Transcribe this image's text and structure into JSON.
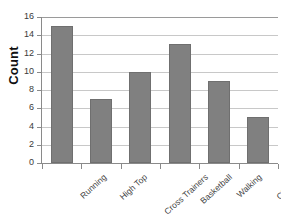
{
  "chart_data": {
    "type": "bar",
    "title": "",
    "xlabel": "",
    "ylabel": "Count",
    "categories": [
      "Running",
      "High Top",
      "Cross Trainers",
      "Basketball",
      "Walking",
      "Climbing"
    ],
    "values": [
      15,
      7,
      10,
      13,
      9,
      5
    ],
    "ylim": [
      0,
      16
    ],
    "ytick_step": 2,
    "yticks": [
      16,
      14,
      12,
      10,
      8,
      6,
      4,
      2,
      0
    ],
    "grid": true,
    "legend": false,
    "bar_color": "#808080",
    "gridline_color": "#c8c8c8",
    "axis_color": "#8a8a8a",
    "background_color": "#ffffff"
  }
}
